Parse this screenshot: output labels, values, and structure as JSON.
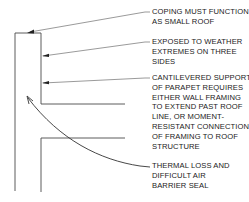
{
  "diagram": {
    "colors": {
      "line": "#4a4a4a",
      "text": "#1a1a1a",
      "background": "#ffffff"
    },
    "annotations": [
      {
        "id": "coping",
        "lines": [
          "COPING MUST FUNCTION",
          "AS SMALL ROOF"
        ]
      },
      {
        "id": "exposure",
        "lines": [
          "EXPOSED TO WEATHER",
          "EXTREMES ON THREE",
          "SIDES"
        ]
      },
      {
        "id": "cantilever",
        "lines": [
          "CANTILEVERED SUPPORT",
          "OF PARAPET REQUIRES",
          "EITHER WALL FRAMING",
          "TO EXTEND PAST ROOF",
          "LINE, OR MOMENT-",
          "RESISTANT CONNECTION",
          "OF FRAMING TO ROOF",
          "STRUCTURE"
        ]
      },
      {
        "id": "thermal",
        "lines": [
          "THERMAL LOSS AND",
          "DIFFICULT AIR",
          "BARRIER SEAL"
        ]
      }
    ]
  }
}
